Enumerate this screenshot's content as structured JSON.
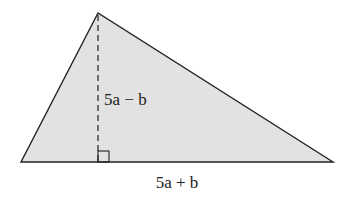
{
  "diagram": {
    "type": "triangle",
    "height_label": "5a − b",
    "base_label": "5a + b",
    "fill_color": "#e2e2e2",
    "stroke_color": "#222222",
    "vertices": {
      "apex": [
        98,
        13
      ],
      "left": [
        21,
        162
      ],
      "right": [
        333,
        162
      ]
    },
    "right_angle_marker": true
  }
}
